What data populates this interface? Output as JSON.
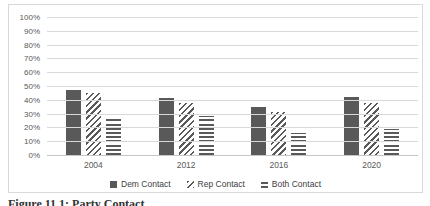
{
  "chart_data": {
    "type": "bar",
    "title": "",
    "xlabel": "",
    "ylabel": "",
    "categories": [
      "2004",
      "2012",
      "2016",
      "2020"
    ],
    "series": [
      {
        "name": "Dem Contact",
        "pattern": "solid",
        "values": [
          47,
          41,
          35,
          42
        ]
      },
      {
        "name": "Rep Contact",
        "pattern": "diagonal",
        "values": [
          45,
          38,
          31,
          38
        ]
      },
      {
        "name": "Both Contact",
        "pattern": "horizontal",
        "values": [
          27,
          28,
          16,
          19
        ]
      }
    ],
    "ylim": [
      0,
      100
    ],
    "ytick_step": 10,
    "ytick_labels": [
      "0%",
      "10%",
      "20%",
      "30%",
      "40%",
      "50%",
      "60%",
      "70%",
      "80%",
      "90%",
      "100%"
    ],
    "grid": true,
    "legend_position": "bottom",
    "colors": {
      "bar": "#595959",
      "gridline": "#d9d9d9",
      "axis_text": "#595959",
      "panel_border": "#d9d9d9"
    }
  },
  "caption": {
    "text": "Figure 11.1: Party Contact"
  }
}
